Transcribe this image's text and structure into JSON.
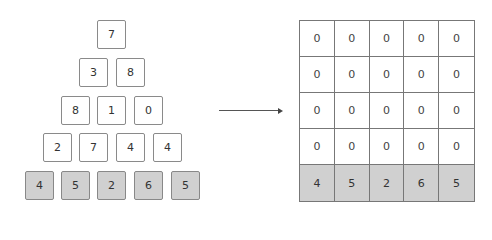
{
  "pyramid": {
    "rows": [
      [
        "7"
      ],
      [
        "3",
        "8"
      ],
      [
        "8",
        "1",
        "0"
      ],
      [
        "2",
        "7",
        "4",
        "4"
      ],
      [
        "4",
        "5",
        "2",
        "6",
        "5"
      ]
    ],
    "base_fill": "#d0d0d0"
  },
  "arrow": {
    "direction": "right"
  },
  "grid": {
    "rows": [
      [
        "0",
        "0",
        "0",
        "0",
        "0"
      ],
      [
        "0",
        "0",
        "0",
        "0",
        "0"
      ],
      [
        "0",
        "0",
        "0",
        "0",
        "0"
      ],
      [
        "0",
        "0",
        "0",
        "0",
        "0"
      ],
      [
        "4",
        "5",
        "2",
        "6",
        "5"
      ]
    ],
    "base_fill": "#d0d0d0"
  }
}
